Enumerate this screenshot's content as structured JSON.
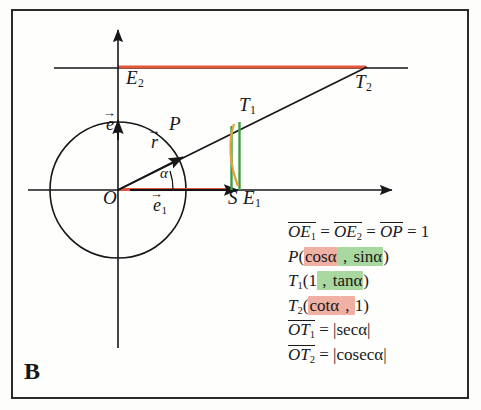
{
  "panel": {
    "label": "B",
    "title": "Unit circle trigonometric definitions"
  },
  "colors": {
    "ink": "#19191c",
    "frame": "#2b2b28",
    "red": "#e2563a",
    "green": "#3f9c45",
    "orange": "#e0a43c",
    "highlight_pink": "#f0b0a4",
    "highlight_green": "#a8d8a0",
    "background": "#fefefd"
  },
  "diagram": {
    "points": {
      "O": {
        "label": "O",
        "x": 118,
        "y": 190,
        "desc": "origin"
      },
      "E1": {
        "label": "E",
        "sub": "1",
        "x": 186,
        "y": 190,
        "desc": "unit point on x-axis"
      },
      "E2": {
        "label": "E",
        "sub": "2",
        "x": 118,
        "y": 122,
        "desc": "unit point on y-axis"
      },
      "P": {
        "label": "P",
        "x": 182,
        "y": 167,
        "desc": "point on unit circle at angle alpha"
      },
      "S": {
        "label": "S",
        "x": 231,
        "y": 190,
        "desc": "foot of perpendicular"
      },
      "T1": {
        "label": "T",
        "sub": "1",
        "x": 238,
        "y": 120,
        "desc": "tangent point on x=1"
      },
      "T2": {
        "label": "T",
        "sub": "2",
        "x": 365,
        "y": 68,
        "desc": "tangent point on y=1"
      }
    },
    "vectors": {
      "e1": {
        "label": "e",
        "sub": "1",
        "accent": "arrow",
        "desc": "unit basis vector along x"
      },
      "e2": {
        "label": "e",
        "sub": "2",
        "accent": "arrow",
        "desc": "unit basis vector along y"
      },
      "r": {
        "label": "r",
        "accent": "arrow",
        "desc": "radius vector to P"
      }
    },
    "angle": {
      "label": "α",
      "degrees": 20,
      "desc": "angle between e1 and r"
    },
    "circle": {
      "center": "O",
      "radius_px": 68,
      "radius_value": 1
    },
    "axes": {
      "x_axis": {
        "from_x": 28,
        "to_x": 400,
        "y": 190,
        "arrow": "right"
      },
      "y_axis": {
        "x": 118,
        "from_y": 345,
        "to_y": 28,
        "arrow": "up"
      }
    },
    "marked_segments": [
      {
        "name": "cos-segment",
        "color": "#e2563a",
        "desc": "O to S along x-axis (cos alpha)"
      },
      {
        "name": "cot-segment",
        "color": "#e2563a",
        "desc": "y-axis to T2 along y=1 (cot alpha)"
      },
      {
        "name": "sin-segment",
        "color": "#3f9c45",
        "desc": "S up to P (sin alpha)"
      },
      {
        "name": "tan-segment",
        "color": "#3f9c45",
        "desc": "E1 up to T1 (tan alpha)"
      },
      {
        "name": "arc-segment",
        "color": "#e0a43c",
        "desc": "arc from P to E1 region"
      }
    ]
  },
  "formulas": [
    {
      "id": "unit-lengths",
      "parts": [
        {
          "text": "OE",
          "style": "italic-overline"
        },
        {
          "text": "1",
          "style": "sub"
        },
        {
          "text": " = ",
          "style": "plain"
        },
        {
          "text": "OE",
          "style": "italic-overline"
        },
        {
          "text": "2",
          "style": "sub"
        },
        {
          "text": " = ",
          "style": "plain"
        },
        {
          "text": "OP",
          "style": "italic-overline"
        },
        {
          "text": " = 1",
          "style": "plain"
        }
      ],
      "plain": "OE1 = OE2 = OP = 1"
    },
    {
      "id": "point-P",
      "plain": "P(cosα , sinα)",
      "name": "P",
      "coord_x": "cosα",
      "coord_y": "sinα",
      "coord_x_highlight": "pink",
      "coord_y_highlight": "green"
    },
    {
      "id": "point-T1",
      "plain": "T1(1 , tanα)",
      "name": "T",
      "sub": "1",
      "coord_x": "1",
      "coord_y": "tanα",
      "coord_y_highlight": "green"
    },
    {
      "id": "point-T2",
      "plain": "T2(cotα , 1)",
      "name": "T",
      "sub": "2",
      "coord_x": "cotα",
      "coord_y": "1",
      "coord_x_highlight": "pink"
    },
    {
      "id": "sec-length",
      "plain": "OT1 = |secα|",
      "lhs": "OT",
      "lhs_sub": "1",
      "rhs": "|secα|"
    },
    {
      "id": "cosec-length",
      "plain": "OT2 = |cosecα|",
      "lhs": "OT",
      "lhs_sub": "2",
      "rhs": "|cosecα|"
    }
  ],
  "text": {
    "E1": "E",
    "E1_sub": "1",
    "E2": "E",
    "E2_sub": "2",
    "O": "O",
    "P": "P",
    "S": "S",
    "T1": "T",
    "T1_sub": "1",
    "T2": "T",
    "T2_sub": "2",
    "alpha": "α",
    "e": "e",
    "r": "r",
    "one": "1",
    "eq": "=",
    "sub1": "1",
    "sub2": "2",
    "OE": "OE",
    "OP": "OP",
    "OT": "OT",
    "eq1": " = ",
    "eqone": " = 1",
    "cos": "cosα",
    "sin": "sinα",
    "tan": "tanα",
    "cot": "cotα",
    "sec": "|secα|",
    "cosec": "|cosecα|",
    "paren_open": "(",
    "paren_close": ")",
    "comma": " , ",
    "B": "B"
  }
}
